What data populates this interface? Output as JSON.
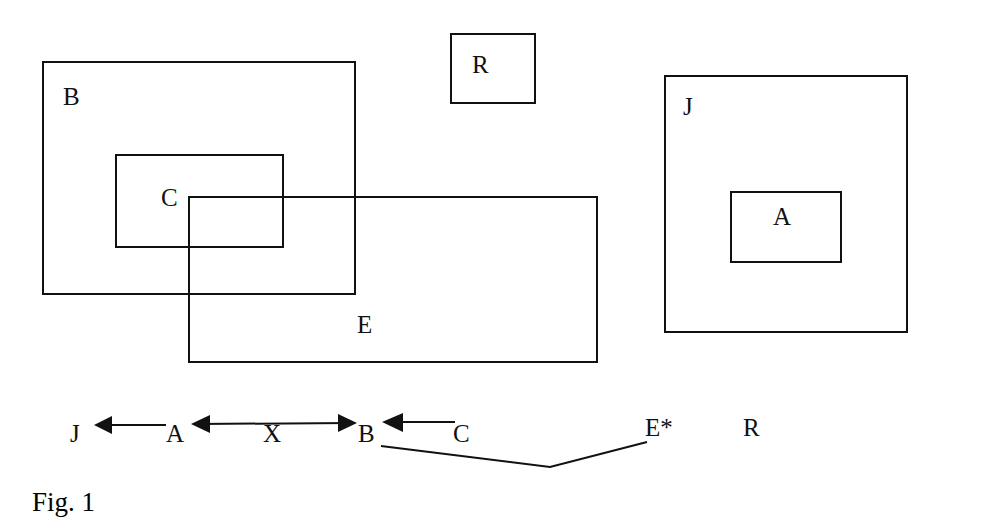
{
  "diagram": {
    "boxes": [
      {
        "id": "B",
        "label": "B"
      },
      {
        "id": "C",
        "label": "C"
      },
      {
        "id": "E",
        "label": "E"
      },
      {
        "id": "R",
        "label": "R"
      },
      {
        "id": "J",
        "label": "J"
      },
      {
        "id": "A",
        "label": "A"
      }
    ],
    "sequence": {
      "nodes": [
        "J",
        "A",
        "X",
        "B",
        "C",
        "E*",
        "R"
      ],
      "edges": [
        {
          "from": "A",
          "to": "J",
          "type": "arrow"
        },
        {
          "from": "X",
          "to": "A",
          "type": "arrow"
        },
        {
          "from": "X",
          "to": "B",
          "type": "arrow"
        },
        {
          "from": "C",
          "to": "B",
          "type": "arrow"
        },
        {
          "from": "B",
          "to": "E*",
          "type": "bracket-line"
        }
      ]
    },
    "caption": "Fig. 1",
    "line_color": "#111111"
  }
}
